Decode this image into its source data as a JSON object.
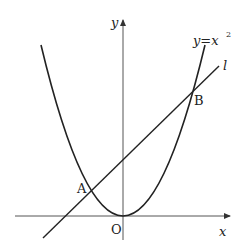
{
  "figure": {
    "axes": {
      "x_label": "x",
      "y_label": "y",
      "origin_label": "O"
    },
    "curve": {
      "label": "y=x",
      "exponent": "2",
      "equation": "y = x^2"
    },
    "line": {
      "label": "l"
    },
    "points": [
      {
        "name": "A",
        "label": "A"
      },
      {
        "name": "B",
        "label": "B"
      }
    ],
    "colors": {
      "stroke": "#222222",
      "axis": "#555555",
      "background": "#ffffff"
    }
  }
}
